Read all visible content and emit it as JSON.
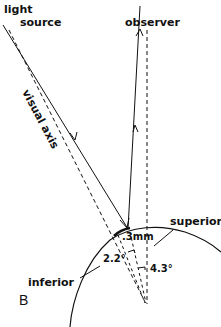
{
  "diagram": {
    "labels": {
      "light_source_line1": "light",
      "light_source_line2": "source",
      "observer": "observer",
      "visual_axis": "visual axis",
      "superior": "superior",
      "inferior": "inferior",
      "distance": ".3mm",
      "angle_small": "2.2°",
      "angle_large": "4.3°",
      "panel": "B"
    },
    "colors": {
      "ink": "#111111",
      "background": "#ffffff"
    }
  }
}
